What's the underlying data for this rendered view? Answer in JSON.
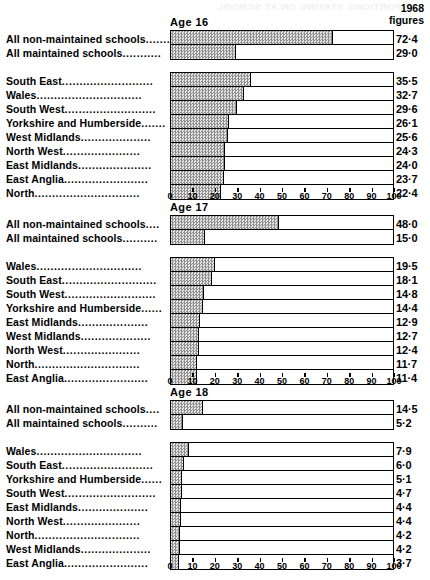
{
  "header": {
    "figures_year": "1968",
    "figures_word": "figures",
    "ghost_title": "PROPORTIONS STAYING ON AT SCHOOL"
  },
  "axis": {
    "ticks": [
      0,
      10,
      20,
      30,
      40,
      50,
      60,
      70,
      80,
      90,
      100
    ],
    "tick_labels": [
      "0",
      "10",
      "20",
      "30",
      "40",
      "50",
      "60",
      "70",
      "80",
      "90",
      "100"
    ],
    "min": 0,
    "max": 100
  },
  "leader_dots": {
    "short": "......",
    "mid": "..........",
    "long": "........................",
    "longer": "............................."
  },
  "chart_data": {
    "type": "bar",
    "title": "1968 figures",
    "xlabel": "",
    "ylabel": "",
    "xlim": [
      0,
      100
    ],
    "grid": false,
    "legend": "none",
    "orientation": "horizontal",
    "note": "Percentage of pupils staying on at school at ages 16, 17 and 18, by school type and region (England and Wales), 1968",
    "panels": [
      {
        "age_label": "Age  16",
        "blocks": [
          {
            "rows": [
              {
                "label": "All non-maintained schools",
                "dots": ".......",
                "value": 72.4,
                "value_text": "72·4"
              },
              {
                "label": "All maintained schools",
                "dots": "...........",
                "value": 29.0,
                "value_text": "29·0"
              }
            ]
          },
          {
            "rows": [
              {
                "label": "South East",
                "dots": "..........................",
                "value": 35.5,
                "value_text": "35·5"
              },
              {
                "label": "Wales",
                "dots": "..............................",
                "value": 32.7,
                "value_text": "32·7"
              },
              {
                "label": "South West",
                "dots": "..........................",
                "value": 29.6,
                "value_text": "29·6"
              },
              {
                "label": "Yorkshire and Humberside",
                "dots": ".......",
                "value": 26.1,
                "value_text": "26·1"
              },
              {
                "label": "West Midlands",
                "dots": "....................",
                "value": 25.6,
                "value_text": "25·6"
              },
              {
                "label": "North West",
                "dots": "......................",
                "value": 24.3,
                "value_text": "24·3"
              },
              {
                "label": "East Midlands",
                "dots": ".....................",
                "value": 24.0,
                "value_text": "24·0"
              },
              {
                "label": "East Anglia",
                "dots": "........................",
                "value": 23.7,
                "value_text": "23·7"
              },
              {
                "label": "North",
                "dots": "..............................",
                "value": 22.4,
                "value_text": "22·4"
              }
            ]
          }
        ]
      },
      {
        "age_label": "Age  17",
        "blocks": [
          {
            "rows": [
              {
                "label": "All non-maintained schools",
                "dots": "....",
                "value": 48.0,
                "value_text": "48·0"
              },
              {
                "label": "All maintained schools",
                "dots": "..........",
                "value": 15.0,
                "value_text": "15·0"
              }
            ]
          },
          {
            "rows": [
              {
                "label": "Wales",
                "dots": "..............................",
                "value": 19.5,
                "value_text": "19·5"
              },
              {
                "label": "South East",
                "dots": "...........................",
                "value": 18.1,
                "value_text": "18·1"
              },
              {
                "label": "South West",
                "dots": "..........................",
                "value": 14.8,
                "value_text": "14·8"
              },
              {
                "label": "Yorkshire and Humberside",
                "dots": "......",
                "value": 14.4,
                "value_text": "14·4"
              },
              {
                "label": "East Midlands",
                "dots": "....................",
                "value": 12.9,
                "value_text": "12·9"
              },
              {
                "label": "West Midlands",
                "dots": "....................",
                "value": 12.7,
                "value_text": "12·7"
              },
              {
                "label": "North West",
                "dots": "......................",
                "value": 12.4,
                "value_text": "12·4"
              },
              {
                "label": "North",
                "dots": "..............................",
                "value": 11.7,
                "value_text": "11·7"
              },
              {
                "label": "East Anglia",
                "dots": "........................",
                "value": 11.4,
                "value_text": "11·4"
              }
            ]
          }
        ]
      },
      {
        "age_label": "Age  18",
        "blocks": [
          {
            "rows": [
              {
                "label": "All non-maintained schools",
                "dots": "....",
                "value": 14.5,
                "value_text": "14·5"
              },
              {
                "label": "All maintained schools",
                "dots": "..........",
                "value": 5.2,
                "value_text": "5·2"
              }
            ]
          },
          {
            "rows": [
              {
                "label": "Wales",
                "dots": "..............................",
                "value": 7.9,
                "value_text": "7·9"
              },
              {
                "label": "South East",
                "dots": "..........................",
                "value": 6.0,
                "value_text": "6·0"
              },
              {
                "label": "Yorkshire and Humberside",
                "dots": "......",
                "value": 5.1,
                "value_text": "5·1"
              },
              {
                "label": "South West",
                "dots": "..........................",
                "value": 4.7,
                "value_text": "4·7"
              },
              {
                "label": "East Midlands",
                "dots": "....................",
                "value": 4.4,
                "value_text": "4·4"
              },
              {
                "label": "North West",
                "dots": "......................",
                "value": 4.4,
                "value_text": "4·4"
              },
              {
                "label": "North",
                "dots": "..............................",
                "value": 4.2,
                "value_text": "4·2"
              },
              {
                "label": "West Midlands",
                "dots": "....................",
                "value": 4.2,
                "value_text": "4·2"
              },
              {
                "label": "East Anglia",
                "dots": "........................",
                "value": 3.7,
                "value_text": "3·7"
              }
            ]
          }
        ]
      }
    ]
  }
}
